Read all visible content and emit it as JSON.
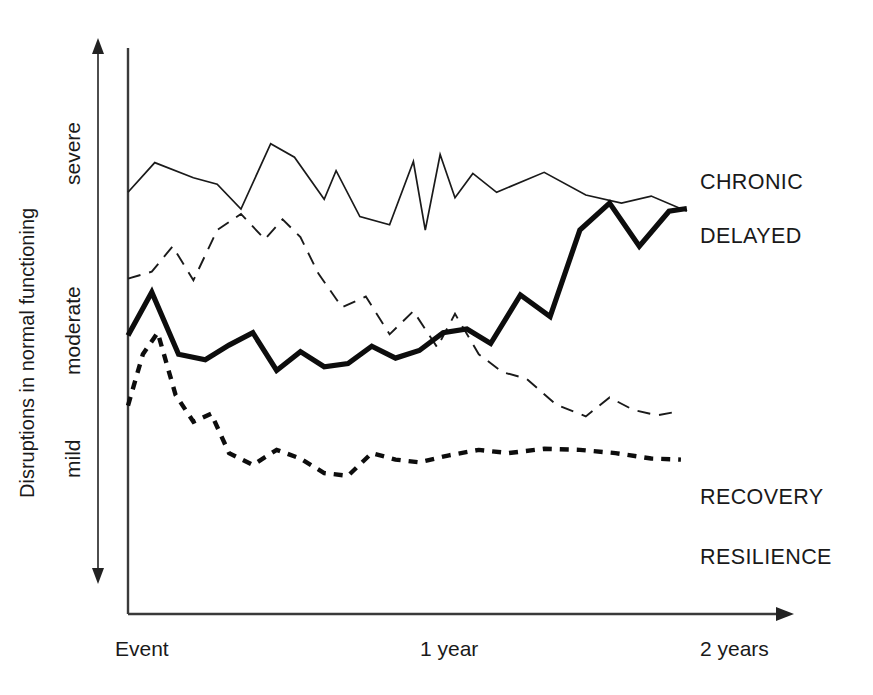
{
  "chart_data": {
    "type": "line",
    "title": "",
    "xlabel": "",
    "ylabel": "Disruptions in normal functioning",
    "y_level_labels": [
      "severe",
      "moderate",
      "mild"
    ],
    "x_tick_labels": [
      "Event",
      "1 year",
      "2 years"
    ],
    "x_tick_positions": [
      0,
      1,
      2
    ],
    "xlim": [
      0,
      2.2
    ],
    "ylim": [
      0,
      10
    ],
    "grid": false,
    "legend_position": "right-inline",
    "y_axis_arrow": "double",
    "x_axis_arrow": "right",
    "series": [
      {
        "name": "CHRONIC",
        "style": "thin-solid",
        "label": "CHRONIC",
        "x": [
          0.0,
          0.09,
          0.22,
          0.3,
          0.38,
          0.48,
          0.56,
          0.66,
          0.7,
          0.78,
          0.88,
          0.96,
          1.0,
          1.05,
          1.1,
          1.16,
          1.24,
          1.4,
          1.54,
          1.66,
          1.76,
          1.88
        ],
        "y": [
          7.55,
          8.1,
          7.82,
          7.7,
          7.24,
          8.45,
          8.2,
          7.42,
          7.95,
          7.1,
          6.95,
          8.12,
          6.85,
          8.25,
          7.45,
          7.9,
          7.55,
          7.92,
          7.5,
          7.35,
          7.48,
          7.2
        ]
      },
      {
        "name": "DELAYED",
        "style": "thick-solid",
        "label": "DELAYED",
        "x": [
          0.0,
          0.08,
          0.17,
          0.26,
          0.34,
          0.42,
          0.5,
          0.58,
          0.66,
          0.74,
          0.82,
          0.9,
          0.98,
          1.06,
          1.14,
          1.22,
          1.32,
          1.42,
          1.52,
          1.62,
          1.72,
          1.82,
          1.88
        ],
        "y": [
          4.9,
          5.7,
          4.55,
          4.45,
          4.72,
          4.95,
          4.25,
          4.6,
          4.32,
          4.38,
          4.7,
          4.48,
          4.62,
          4.95,
          5.02,
          4.75,
          5.65,
          5.25,
          6.85,
          7.35,
          6.55,
          7.2,
          7.25
        ]
      },
      {
        "name": "RECOVERY",
        "style": "dashed",
        "label": "RECOVERY",
        "x": [
          0.0,
          0.08,
          0.15,
          0.22,
          0.3,
          0.38,
          0.46,
          0.52,
          0.58,
          0.64,
          0.72,
          0.8,
          0.88,
          0.96,
          1.04,
          1.1,
          1.18,
          1.26,
          1.34,
          1.44,
          1.54,
          1.62,
          1.7,
          1.78,
          1.84
        ],
        "y": [
          5.95,
          6.08,
          6.55,
          5.92,
          6.85,
          7.15,
          6.68,
          7.05,
          6.72,
          6.05,
          5.42,
          5.62,
          4.92,
          5.35,
          4.68,
          5.3,
          4.55,
          4.22,
          4.1,
          3.62,
          3.4,
          3.75,
          3.52,
          3.42,
          3.48
        ]
      },
      {
        "name": "RESILIENCE",
        "style": "dotted",
        "label": "RESILIENCE",
        "x": [
          0.0,
          0.05,
          0.1,
          0.16,
          0.22,
          0.28,
          0.34,
          0.42,
          0.5,
          0.58,
          0.66,
          0.74,
          0.82,
          0.9,
          0.98,
          1.08,
          1.18,
          1.28,
          1.4,
          1.52,
          1.64,
          1.76,
          1.86
        ],
        "y": [
          3.6,
          4.55,
          4.95,
          3.8,
          3.3,
          3.45,
          2.72,
          2.5,
          2.78,
          2.62,
          2.35,
          2.3,
          2.72,
          2.6,
          2.55,
          2.68,
          2.78,
          2.72,
          2.8,
          2.78,
          2.72,
          2.62,
          2.6
        ]
      }
    ]
  },
  "axis": {
    "y_title": "Disruptions in normal functioning",
    "levels": {
      "severe": "severe",
      "moderate": "moderate",
      "mild": "mild"
    },
    "x_ticks": {
      "event": "Event",
      "one_year": "1 year",
      "two_years": "2 years"
    }
  },
  "legend": {
    "chronic": "CHRONIC",
    "delayed": "DELAYED",
    "recovery": "RECOVERY",
    "resilience": "RESILIENCE"
  },
  "colors": {
    "ink": "#1a1a1a",
    "axis": "#3a3a3a",
    "background": "#ffffff"
  }
}
